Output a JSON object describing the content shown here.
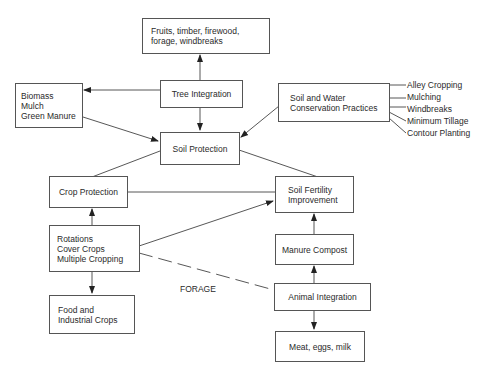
{
  "diagram": {
    "nodes": {
      "products_trees": {
        "lines": [
          "Fruits, timber, firewood,",
          "forage, windbreaks"
        ]
      },
      "tree_integration": {
        "lines": [
          "Tree Integration"
        ]
      },
      "biomass": {
        "lines": [
          "Biomass",
          "Mulch",
          "Green Manure"
        ]
      },
      "soil_protection": {
        "lines": [
          "Soil Protection"
        ]
      },
      "soil_water": {
        "lines": [
          "Soil and Water",
          "Conservation Practices"
        ]
      },
      "crop_protection": {
        "lines": [
          "Crop Protection"
        ]
      },
      "soil_fertility": {
        "lines": [
          "Soil Fertility",
          "Improvement"
        ]
      },
      "rotations": {
        "lines": [
          "Rotations",
          "Cover Crops",
          "Multiple Cropping"
        ]
      },
      "manure_compost": {
        "lines": [
          "Manure Compost"
        ]
      },
      "animal_integration": {
        "lines": [
          "Animal Integration"
        ]
      },
      "food_crops": {
        "lines": [
          "Food and",
          "Industrial Crops"
        ]
      },
      "animal_products": {
        "lines": [
          "Meat, eggs, milk"
        ]
      }
    },
    "conservation_practices": [
      "Alley Cropping",
      "Mulching",
      "Windbreaks",
      "Minimum Tillage",
      "Contour Planting"
    ],
    "edge_labels": {
      "forage": "FORAGE"
    }
  }
}
